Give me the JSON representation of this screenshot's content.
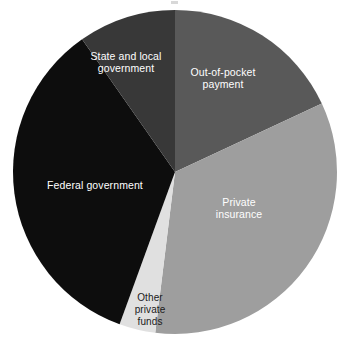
{
  "chart_data": {
    "type": "pie",
    "title": "",
    "xlabel": "",
    "ylabel": "",
    "legend_position": "none",
    "labels_placement": "inside-slices",
    "grid": false,
    "start_angle_deg": 0,
    "direction": "clockwise",
    "categories": [
      "Out-of-pocket payment",
      "Private insurance",
      "Other private funds",
      "Federal government",
      "State and local government"
    ],
    "values": [
      18,
      34,
      4,
      34,
      10
    ],
    "units": "percent",
    "slices": [
      {
        "label": "Out-of-pocket\npayment",
        "name": "Out-of-pocket payment",
        "value": 18,
        "start_deg": 0,
        "end_deg": 65,
        "color": "#595959",
        "text_color": "#ffffff"
      },
      {
        "label": "Private\ninsurance",
        "name": "Private insurance",
        "value": 34,
        "start_deg": 65,
        "end_deg": 187,
        "color": "#9e9e9e",
        "text_color": "#ffffff"
      },
      {
        "label": "Other\nprivate\nfunds",
        "name": "Other private funds",
        "value": 4,
        "start_deg": 187,
        "end_deg": 200,
        "color": "#e0e0e0",
        "text_color": "#1a1a1a"
      },
      {
        "label": "Federal government",
        "name": "Federal government",
        "value": 34,
        "start_deg": 200,
        "end_deg": 325,
        "color": "#0d0d0d",
        "text_color": "#ffffff"
      },
      {
        "label": "State and local\ngovernment",
        "name": "State and local government",
        "value": 10,
        "start_deg": 325,
        "end_deg": 360,
        "color": "#383838",
        "text_color": "#ffffff"
      }
    ],
    "geometry": {
      "center_x": 175,
      "center_y": 172,
      "radius": 162
    },
    "background_color": "#ffffff"
  }
}
